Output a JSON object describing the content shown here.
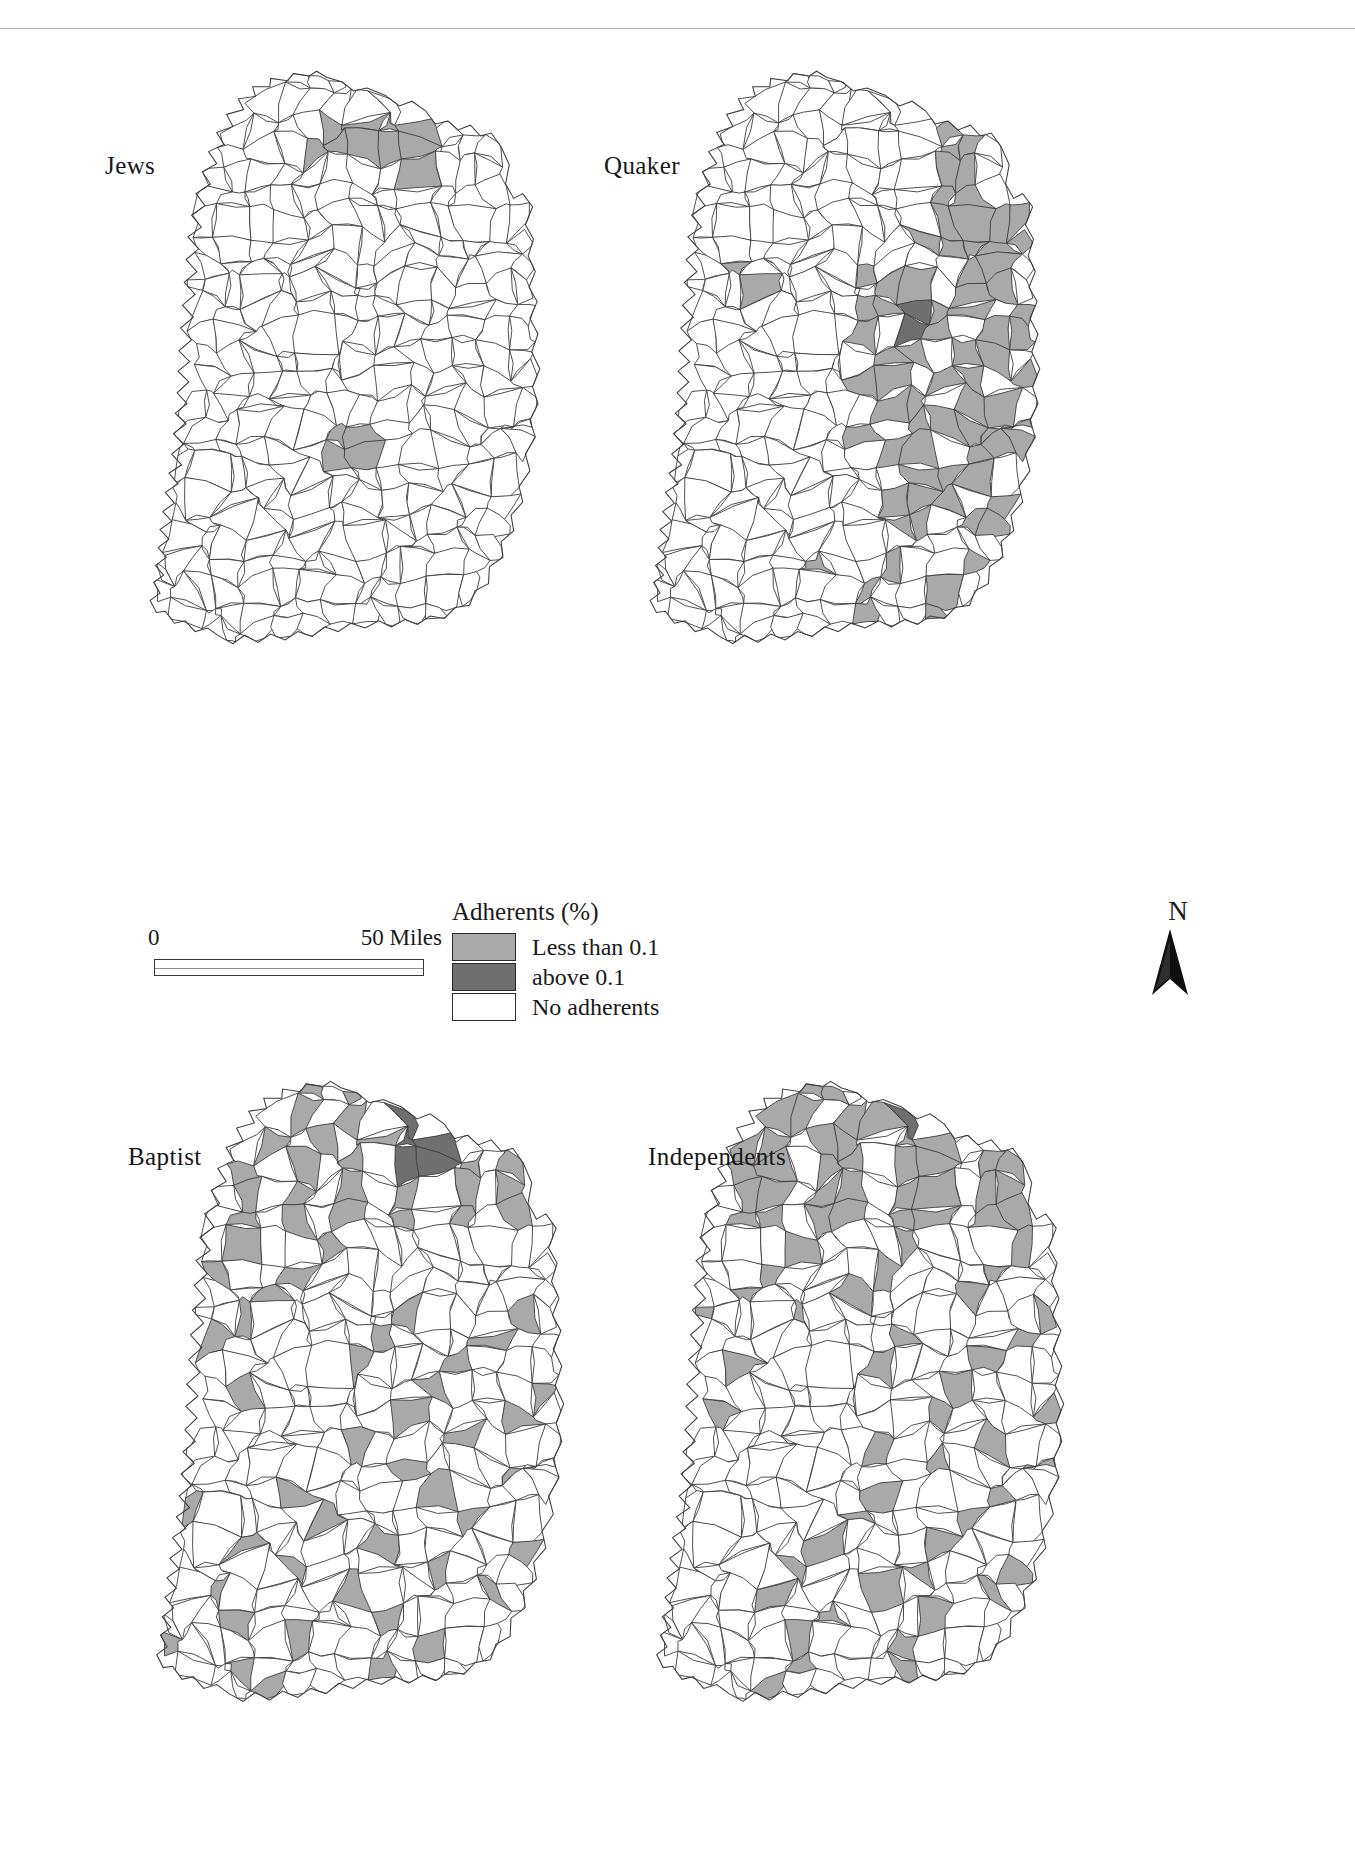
{
  "figure": {
    "panels": [
      {
        "id": "jews",
        "label": "Jews",
        "position": "top-left"
      },
      {
        "id": "quaker",
        "label": "Quaker",
        "position": "top-right"
      },
      {
        "id": "baptist",
        "label": "Baptist",
        "position": "bottom-left"
      },
      {
        "id": "independents",
        "label": "Independents",
        "position": "bottom-right"
      }
    ]
  },
  "legend": {
    "title": "Adherents (%)",
    "items": [
      {
        "label": "Less than 0.1",
        "color": "#a9a9a9",
        "class": "light-gray"
      },
      {
        "label": "above 0.1",
        "color": "#6f6f6f",
        "class": "dark-gray"
      },
      {
        "label": "No adherents",
        "color": "#ffffff",
        "class": "white"
      }
    ]
  },
  "scalebar": {
    "zero_label": "0",
    "max_label": "50 Miles",
    "units": "Miles",
    "max_value": 50
  },
  "north_arrow": {
    "letter": "N",
    "icon": "north-arrow-icon"
  },
  "caption": {
    "text": ""
  },
  "chart_data": {
    "type": "choropleth-map-grid",
    "title": "",
    "region": "Ireland",
    "subdivisions": "counties / baronies",
    "classes": [
      {
        "name": "Less than 0.1",
        "color": "#a9a9a9"
      },
      {
        "name": "above 0.1",
        "color": "#6f6f6f"
      },
      {
        "name": "No adherents",
        "color": "#ffffff"
      }
    ],
    "variable": "Adherents (%)",
    "maps": [
      {
        "name": "Jews",
        "shaded_light_count": 5,
        "shaded_dark_count": 0
      },
      {
        "name": "Quaker",
        "shaded_light_count": 74,
        "shaded_dark_count": 1
      },
      {
        "name": "Baptist",
        "shaded_light_count": 58,
        "shaded_dark_count": 3
      },
      {
        "name": "Independents",
        "shaded_light_count": 52,
        "shaded_dark_count": 3
      }
    ],
    "legend_position": "center",
    "grid": false
  }
}
